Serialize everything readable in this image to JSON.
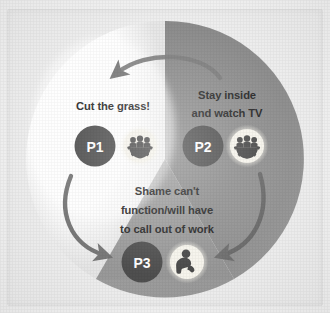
{
  "image": {
    "kind": "cycle-diagram-photo",
    "background_color": "#f2f2f2",
    "frame_color": "#eeeeee"
  },
  "diagram": {
    "type": "three-segment-cycle",
    "center": {
      "x": 158,
      "y": 150
    },
    "radius": 138,
    "segments": [
      {
        "id": "p1",
        "badge_label": "P1",
        "badge_color": "#4f4f4f",
        "segment_color": "#fbfbfb",
        "icon_name": "group-gear-icon",
        "icon_background": "#f4f2ea",
        "icon_color": "#4a4a4a",
        "text_color": "#2b2b2b",
        "lines": [
          "Cut the grass!"
        ]
      },
      {
        "id": "p2",
        "badge_label": "P2",
        "badge_color": "#4f4f4f",
        "segment_color": "#8a8a8a",
        "icon_name": "group-gear-icon",
        "icon_background": "#f4f2ea",
        "icon_color": "#4a4a4a",
        "text_color": "#2b2b2b",
        "lines": [
          "Stay inside",
          "and watch TV"
        ]
      },
      {
        "id": "p3",
        "badge_label": "P3",
        "badge_color": "#4f4f4f",
        "segment_color": "#9e9e9e",
        "icon_name": "person-sitting-icon",
        "icon_background": "#f4f2ea",
        "icon_color": "#4a4a4a",
        "text_color": "#2b2b2b",
        "lines": [
          "Shame can't",
          "function/will have",
          "to call out of work"
        ]
      }
    ],
    "arrows": [
      {
        "id": "arrow-p2-to-p1",
        "name": "arrow-top",
        "color": "#7d7d7d"
      },
      {
        "id": "arrow-p1-to-p3",
        "name": "arrow-left",
        "color": "#6e6e6e"
      },
      {
        "id": "arrow-p2-to-p3",
        "name": "arrow-right",
        "color": "#6a6a6a"
      }
    ]
  }
}
